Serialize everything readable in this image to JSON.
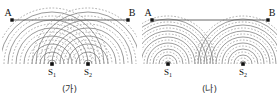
{
  "figure": {
    "title_visible": false,
    "panels": [
      {
        "id": "ga",
        "caption": "(가)",
        "endpoint_left_label": "A",
        "endpoint_right_label": "B",
        "source1_label": "S",
        "source1_sub": "1",
        "source2_label": "S",
        "source2_sub": "2",
        "line_color": "#555555",
        "crest_color": "#7a7a7a",
        "trough_color": "#8d8d8d",
        "dot_color": "#111111",
        "geometry": {
          "A": [
            12,
            20
          ],
          "B": [
            128,
            20
          ],
          "S1": [
            52,
            64
          ],
          "S2": [
            88,
            64
          ],
          "wavelength": 8,
          "ring_count": 7
        }
      },
      {
        "id": "na",
        "caption": "(나)",
        "endpoint_left_label": "A",
        "endpoint_right_label": "B",
        "source1_label": "S",
        "source1_sub": "1",
        "source2_label": "S",
        "source2_sub": "2",
        "line_color": "#555555",
        "crest_color": "#7a7a7a",
        "trough_color": "#8d8d8d",
        "dot_color": "#111111",
        "geometry": {
          "A": [
            12,
            20
          ],
          "B": [
            128,
            20
          ],
          "S1": [
            28,
            64
          ],
          "S2": [
            103,
            64
          ],
          "wavelength": 6,
          "ring_count": 8
        }
      }
    ]
  },
  "chart_data": {
    "type": "diagram",
    "panels": [
      {
        "label": "(가)",
        "sources": [
          "S1",
          "S2"
        ],
        "source_separation_px": 36,
        "wavelength_px": 8,
        "line_endpoints": [
          "A",
          "B"
        ],
        "crest_style": "solid",
        "trough_style": "dashed"
      },
      {
        "label": "(나)",
        "sources": [
          "S1",
          "S2"
        ],
        "source_separation_px": 75,
        "wavelength_px": 6,
        "line_endpoints": [
          "A",
          "B"
        ],
        "crest_style": "solid",
        "trough_style": "dashed"
      }
    ]
  }
}
